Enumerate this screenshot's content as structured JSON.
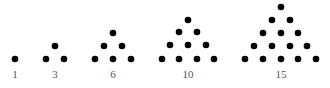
{
  "dot_color": "#000000",
  "label_color": "#555555",
  "figures": [
    {
      "label": "1",
      "label_x": 15,
      "dots": [
        [
          15,
          59
        ]
      ]
    },
    {
      "label": "3",
      "label_x": 55,
      "dots": [
        [
          46,
          59
        ],
        [
          64,
          59
        ],
        [
          55,
          46
        ]
      ]
    },
    {
      "label": "6",
      "label_x": 113,
      "dots": [
        [
          95,
          59
        ],
        [
          113,
          59
        ],
        [
          131,
          59
        ],
        [
          104,
          46
        ],
        [
          122,
          46
        ],
        [
          113,
          33
        ]
      ]
    },
    {
      "label": "10",
      "label_x": 188,
      "dots": [
        [
          162,
          59
        ],
        [
          179,
          59
        ],
        [
          197,
          59
        ],
        [
          214,
          59
        ],
        [
          170,
          45
        ],
        [
          188,
          45
        ],
        [
          206,
          45
        ],
        [
          179,
          32
        ],
        [
          197,
          32
        ],
        [
          188,
          20
        ]
      ]
    },
    {
      "label": "15",
      "label_x": 281,
      "dots": [
        [
          245,
          59
        ],
        [
          263,
          59
        ],
        [
          281,
          59
        ],
        [
          298,
          59
        ],
        [
          316,
          59
        ],
        [
          254,
          46
        ],
        [
          272,
          46
        ],
        [
          290,
          46
        ],
        [
          307,
          46
        ],
        [
          263,
          33
        ],
        [
          281,
          33
        ],
        [
          298,
          33
        ],
        [
          272,
          20
        ],
        [
          290,
          20
        ],
        [
          281,
          7
        ]
      ]
    }
  ]
}
